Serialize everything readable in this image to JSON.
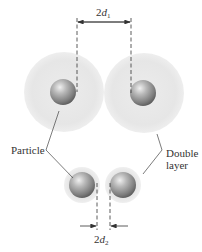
{
  "diagram": {
    "labels": {
      "particle": "Particle",
      "double_layer_line1": "Double",
      "double_layer_line2": "layer"
    },
    "dimensions": {
      "top": {
        "coefficient": "2",
        "variable": "d",
        "subscript": "1"
      },
      "bottom": {
        "coefficient": "2",
        "variable": "d",
        "subscript": "2"
      }
    },
    "states": [
      {
        "name": "dispersed",
        "separation": "2d1",
        "double_layer": "thick"
      },
      {
        "name": "compressed",
        "separation": "2d2",
        "double_layer": "thin"
      }
    ],
    "colors": {
      "double_layer": "#e9e9e9",
      "particle_highlight": "#e0e0e0",
      "particle_shadow": "#6e6e6e",
      "line": "#333333"
    }
  }
}
